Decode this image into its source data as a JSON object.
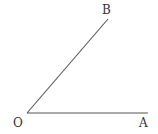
{
  "diagram": {
    "type": "angle",
    "stroke_color": "#555555",
    "label_color": "#333333",
    "points": {
      "O": {
        "label": "O",
        "x": 27,
        "y": 113
      },
      "A": {
        "label": "A",
        "x": 148,
        "y": 113
      },
      "B": {
        "label": "B",
        "x": 108,
        "y": 19
      }
    },
    "segments": [
      {
        "from": "O",
        "to": "A"
      },
      {
        "from": "O",
        "to": "B"
      }
    ]
  }
}
